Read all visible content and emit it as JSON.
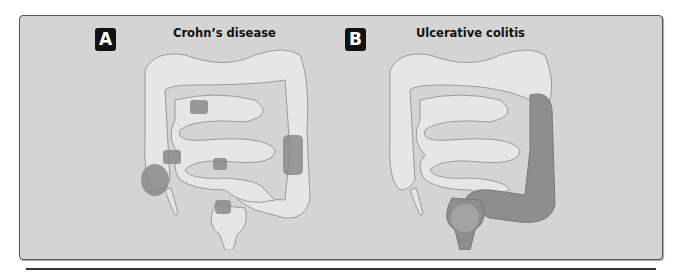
{
  "panels": [
    {
      "badge": "A",
      "title": "Crohn’s disease",
      "description": "Colon and small intestine with patchy (skip) inflamed segments shown darker",
      "affected_color": "#8a8a8a"
    },
    {
      "badge": "B",
      "title": "Ulcerative colitis",
      "description": "Colon with continuous inflammation from rectum up the descending colon shown darker",
      "affected_color": "#8e8e8e"
    }
  ],
  "colors": {
    "background": "#d4d4d4",
    "healthy_tissue": "#e6e6e6",
    "tissue_outline": "#9a9a9a",
    "badge": "#111111"
  }
}
